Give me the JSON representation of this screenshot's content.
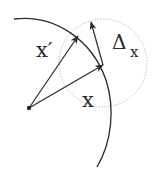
{
  "diagram": {
    "labels": {
      "x_prime": "x′",
      "x": "x",
      "delta": "Δ",
      "delta_subscript": "x"
    },
    "colors": {
      "stroke": "#2a2a2a",
      "dotted_circle": "#b8b8b8",
      "background": "#ffffff"
    },
    "elements": {
      "manifold_arc": "solid curve (constraint surface)",
      "neighborhood": "dotted circle around x",
      "vector_x": "arrow from origin to x",
      "vector_x_prime": "arrow from origin to x′",
      "vector_delta": "arrow from x to perturbed point"
    }
  }
}
